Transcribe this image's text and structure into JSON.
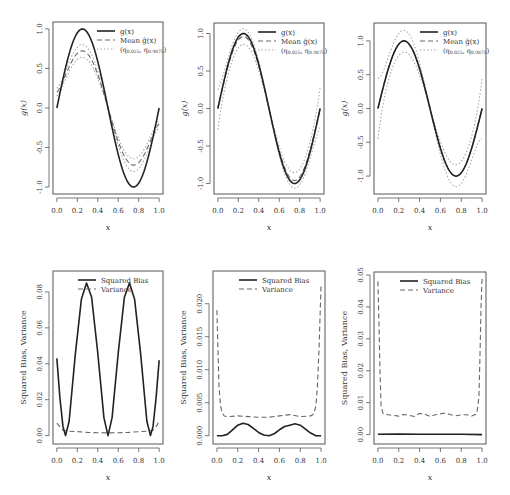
{
  "figure": {
    "layout": "2x3 grid of panels",
    "line_styles": {
      "solid": "#222222",
      "dashed": "#666666",
      "dotted": "#a8a8a8"
    }
  },
  "chart_data": [
    {
      "id": "top-left",
      "type": "line",
      "title": "",
      "xlabel": "x",
      "ylabel": "g(x)",
      "xlim": [
        0,
        1
      ],
      "ylim": [
        -1.05,
        1.05
      ],
      "xticks": [
        0.0,
        0.2,
        0.4,
        0.6,
        0.8,
        1.0
      ],
      "xtick_labels": [
        "0.0",
        "0.2",
        "0.4",
        "0.6",
        "0.8",
        "1.0"
      ],
      "yticks": [
        -1.0,
        -0.5,
        0.0,
        0.5,
        1.0
      ],
      "ytick_labels": [
        "-1.0",
        "-0.5",
        "0.0",
        "0.5",
        "1.0"
      ],
      "grid": false,
      "legend": {
        "position": "top-right",
        "entries": [
          {
            "label": "g(x)",
            "style": "solid"
          },
          {
            "label": "Mean ĝ(x)",
            "style": "dashed"
          },
          {
            "label": "(q0.025, q0.9875)",
            "style": "dotted"
          }
        ]
      },
      "series": [
        {
          "name": "g(x)",
          "style": "solid",
          "kind": "sin",
          "amp": 1.0,
          "offset": 0.0
        },
        {
          "name": "Mean ĝ(x)",
          "style": "dashed",
          "kind": "sin",
          "amp": 0.72,
          "offset": 0.0,
          "edge": 0.2
        },
        {
          "name": "q0.025",
          "style": "dotted",
          "kind": "sin",
          "amp": 0.64,
          "offset": 0.0,
          "edge": 0.15
        },
        {
          "name": "q0.9875",
          "style": "dotted",
          "kind": "sin",
          "amp": 0.8,
          "offset": 0.0,
          "edge": 0.25
        }
      ]
    },
    {
      "id": "top-middle",
      "type": "line",
      "title": "",
      "xlabel": "x",
      "ylabel": "g(x)",
      "xlim": [
        0,
        1
      ],
      "ylim": [
        -1.1,
        1.1
      ],
      "xticks": [
        0.0,
        0.2,
        0.4,
        0.6,
        0.8,
        1.0
      ],
      "xtick_labels": [
        "0.0",
        "0.2",
        "0.4",
        "0.6",
        "0.8",
        "1.0"
      ],
      "yticks": [
        -1.0,
        -0.5,
        0.0,
        0.5,
        1.0
      ],
      "ytick_labels": [
        "-1.0",
        "-0.5",
        "0.0",
        "0.5",
        "1.0"
      ],
      "grid": false,
      "legend": {
        "position": "top-right",
        "entries": [
          {
            "label": "g(x)",
            "style": "solid"
          },
          {
            "label": "Mean ĝ(x)",
            "style": "dashed"
          },
          {
            "label": "(q0.025, q0.9875)",
            "style": "dotted"
          }
        ]
      },
      "series": [
        {
          "name": "g(x)",
          "style": "solid",
          "kind": "sin",
          "amp": 1.0,
          "offset": 0.0
        },
        {
          "name": "Mean ĝ(x)",
          "style": "dashed",
          "kind": "sin",
          "amp": 0.96,
          "offset": 0.0
        },
        {
          "name": "q0.025",
          "style": "dotted",
          "kind": "sin",
          "amp": 0.86,
          "offset": 0.0,
          "edge": -0.28
        },
        {
          "name": "q0.9875",
          "style": "dotted",
          "kind": "sin",
          "amp": 1.06,
          "offset": 0.0,
          "edge": 0.25
        }
      ]
    },
    {
      "id": "top-right",
      "type": "line",
      "title": "",
      "xlabel": "x",
      "ylabel": "g(x)",
      "xlim": [
        0,
        1
      ],
      "ylim": [
        -1.22,
        1.22
      ],
      "xticks": [
        0.0,
        0.2,
        0.4,
        0.6,
        0.8,
        1.0
      ],
      "xtick_labels": [
        "0.0",
        "0.2",
        "0.4",
        "0.6",
        "0.8",
        "1.0"
      ],
      "yticks": [
        -1.0,
        -0.5,
        0.0,
        0.5,
        1.0
      ],
      "ytick_labels": [
        "-1.0",
        "-0.5",
        "0.0",
        "0.5",
        "1.0"
      ],
      "grid": false,
      "legend": {
        "position": "top-right",
        "entries": [
          {
            "label": "g(x)",
            "style": "solid"
          },
          {
            "label": "Mean ĝ(x)",
            "style": "dashed"
          },
          {
            "label": "(q0.025, q0.9875)",
            "style": "dotted"
          }
        ]
      },
      "series": [
        {
          "name": "g(x)",
          "style": "solid",
          "kind": "sin",
          "amp": 1.0,
          "offset": 0.0
        },
        {
          "name": "Mean ĝ(x)",
          "style": "dashed",
          "kind": "sin",
          "amp": 1.0,
          "offset": 0.0
        },
        {
          "name": "q0.025",
          "style": "dotted",
          "kind": "sin",
          "amp": 0.84,
          "offset": 0.0,
          "edge": -0.45
        },
        {
          "name": "q0.9875",
          "style": "dotted",
          "kind": "sin",
          "amp": 1.15,
          "offset": 0.0,
          "edge": 0.45
        }
      ]
    },
    {
      "id": "bottom-left",
      "type": "line",
      "title": "",
      "xlabel": "x",
      "ylabel": "Squared Bias, Variance",
      "xlim": [
        0,
        1
      ],
      "ylim": [
        -0.003,
        0.09
      ],
      "xticks": [
        0.0,
        0.2,
        0.4,
        0.6,
        0.8,
        1.0
      ],
      "xtick_labels": [
        "0.0",
        "0.2",
        "0.4",
        "0.6",
        "0.8",
        "1.0"
      ],
      "yticks": [
        0.0,
        0.02,
        0.04,
        0.06,
        0.08
      ],
      "ytick_labels": [
        "0.00",
        "0.02",
        "0.04",
        "0.06",
        "0.08"
      ],
      "grid": false,
      "legend": {
        "position": "top-center",
        "entries": [
          {
            "label": "Squared Bias",
            "style": "solid"
          },
          {
            "label": "Variance",
            "style": "dashed"
          }
        ]
      },
      "series": [
        {
          "name": "Squared Bias",
          "style": "solid",
          "x": [
            0.0,
            0.03,
            0.06,
            0.085,
            0.12,
            0.18,
            0.24,
            0.29,
            0.34,
            0.4,
            0.46,
            0.5,
            0.54,
            0.6,
            0.66,
            0.71,
            0.76,
            0.82,
            0.88,
            0.915,
            0.94,
            0.97,
            1.0
          ],
          "y": [
            0.043,
            0.021,
            0.005,
            0.0,
            0.008,
            0.045,
            0.076,
            0.085,
            0.077,
            0.046,
            0.01,
            0.0,
            0.01,
            0.046,
            0.077,
            0.085,
            0.076,
            0.045,
            0.008,
            0.0,
            0.005,
            0.021,
            0.042
          ]
        },
        {
          "name": "Variance",
          "style": "dashed",
          "x": [
            0.0,
            0.03,
            0.06,
            0.1,
            0.2,
            0.3,
            0.4,
            0.5,
            0.6,
            0.7,
            0.8,
            0.9,
            0.94,
            0.97,
            1.0
          ],
          "y": [
            0.007,
            0.005,
            0.003,
            0.0025,
            0.0022,
            0.0018,
            0.0016,
            0.0015,
            0.0016,
            0.0018,
            0.0022,
            0.0025,
            0.003,
            0.005,
            0.008
          ]
        }
      ]
    },
    {
      "id": "bottom-middle",
      "type": "line",
      "title": "",
      "xlabel": "x",
      "ylabel": "Squared Bias, Variance",
      "xlim": [
        0,
        1
      ],
      "ylim": [
        -0.0008,
        0.0245
      ],
      "xticks": [
        0.0,
        0.2,
        0.4,
        0.6,
        0.8,
        1.0
      ],
      "xtick_labels": [
        "0.0",
        "0.2",
        "0.4",
        "0.6",
        "0.8",
        "1.0"
      ],
      "yticks": [
        0.0,
        0.005,
        0.01,
        0.015,
        0.02
      ],
      "ytick_labels": [
        "0.000",
        "0.005",
        "0.010",
        "0.015",
        "0.020"
      ],
      "grid": false,
      "legend": {
        "position": "top-center",
        "entries": [
          {
            "label": "Squared Bias",
            "style": "solid"
          },
          {
            "label": "Variance",
            "style": "dashed"
          }
        ]
      },
      "series": [
        {
          "name": "Squared Bias",
          "style": "solid",
          "x": [
            0.0,
            0.05,
            0.1,
            0.15,
            0.2,
            0.25,
            0.3,
            0.35,
            0.4,
            0.45,
            0.5,
            0.55,
            0.6,
            0.65,
            0.7,
            0.75,
            0.8,
            0.85,
            0.9,
            0.95,
            1.0
          ],
          "y": [
            0.0,
            0.0,
            0.0002,
            0.0009,
            0.0016,
            0.0019,
            0.0017,
            0.0011,
            0.0005,
            0.0001,
            0.0,
            0.0003,
            0.0009,
            0.0014,
            0.0016,
            0.0018,
            0.0016,
            0.001,
            0.0004,
            0.0,
            0.0
          ]
        },
        {
          "name": "Variance",
          "style": "dashed",
          "x": [
            0.0,
            0.01,
            0.02,
            0.035,
            0.05,
            0.07,
            0.1,
            0.2,
            0.3,
            0.4,
            0.5,
            0.6,
            0.7,
            0.8,
            0.9,
            0.93,
            0.95,
            0.965,
            0.98,
            0.99,
            1.0
          ],
          "y": [
            0.019,
            0.013,
            0.0075,
            0.0045,
            0.0035,
            0.003,
            0.0029,
            0.003,
            0.0029,
            0.0028,
            0.0028,
            0.003,
            0.0032,
            0.0029,
            0.003,
            0.0033,
            0.0045,
            0.0075,
            0.013,
            0.018,
            0.023
          ]
        }
      ]
    },
    {
      "id": "bottom-right",
      "type": "line",
      "title": "",
      "xlabel": "x",
      "ylabel": "Squared Bias, Variance",
      "xlim": [
        0,
        1
      ],
      "ylim": [
        -0.002,
        0.05
      ],
      "xticks": [
        0.0,
        0.2,
        0.4,
        0.6,
        0.8,
        1.0
      ],
      "xtick_labels": [
        "0.0",
        "0.2",
        "0.4",
        "0.6",
        "0.8",
        "1.0"
      ],
      "yticks": [
        0.0,
        0.01,
        0.02,
        0.03,
        0.04,
        0.05
      ],
      "ytick_labels": [
        "0.00",
        "0.01",
        "0.02",
        "0.03",
        "0.04",
        "0.05"
      ],
      "grid": false,
      "legend": {
        "position": "top-center",
        "entries": [
          {
            "label": "Squared Bias",
            "style": "solid"
          },
          {
            "label": "Variance",
            "style": "dashed"
          }
        ]
      },
      "series": [
        {
          "name": "Squared Bias",
          "style": "solid",
          "x": [
            0.0,
            0.2,
            0.4,
            0.6,
            0.8,
            1.0
          ],
          "y": [
            0.0001,
            0.0002,
            0.0001,
            0.0001,
            0.0001,
            0.0
          ]
        },
        {
          "name": "Variance",
          "style": "dashed",
          "x": [
            0.0,
            0.01,
            0.02,
            0.03,
            0.05,
            0.1,
            0.15,
            0.2,
            0.25,
            0.3,
            0.35,
            0.4,
            0.45,
            0.5,
            0.55,
            0.6,
            0.65,
            0.7,
            0.75,
            0.8,
            0.85,
            0.9,
            0.95,
            0.97,
            0.98,
            0.99,
            1.0
          ],
          "y": [
            0.048,
            0.035,
            0.02,
            0.009,
            0.0065,
            0.0062,
            0.006,
            0.0058,
            0.0063,
            0.006,
            0.0057,
            0.0066,
            0.0064,
            0.0057,
            0.0062,
            0.0065,
            0.0068,
            0.0062,
            0.0059,
            0.0062,
            0.0062,
            0.0058,
            0.0065,
            0.012,
            0.025,
            0.04,
            0.049
          ]
        }
      ]
    }
  ]
}
